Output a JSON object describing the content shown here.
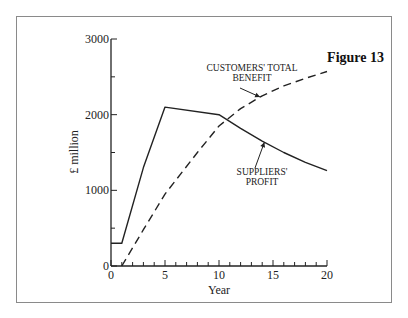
{
  "figure_label": "Figure 13",
  "chart_data": {
    "type": "line",
    "title": "Figure 13",
    "xlabel": "Year",
    "ylabel": "£ million",
    "xlim": [
      0,
      20
    ],
    "ylim": [
      0,
      3000
    ],
    "x_ticks_major": [
      0,
      5,
      10,
      15,
      20
    ],
    "x_ticks_minor_step": 1,
    "y_ticks_major": [
      0,
      1000,
      2000,
      3000
    ],
    "y_ticks_minor_step": 500,
    "grid": false,
    "legend": "none (inline annotations with arrows)",
    "series": [
      {
        "name": "Suppliers' profit",
        "style": "solid",
        "x": [
          0,
          1,
          3,
          5,
          10,
          12,
          14,
          16,
          18,
          20
        ],
        "y": [
          300,
          300,
          1300,
          2100,
          2000,
          1820,
          1650,
          1500,
          1370,
          1260
        ]
      },
      {
        "name": "Customers' total benefit",
        "style": "dashed",
        "x": [
          1,
          3,
          5,
          8,
          10,
          12,
          14,
          16,
          18,
          20
        ],
        "y": [
          0,
          480,
          950,
          1500,
          1850,
          2080,
          2250,
          2380,
          2480,
          2570
        ]
      }
    ],
    "annotations": [
      {
        "text": [
          "CUSTOMERS' TOTAL",
          "BENEFIT"
        ],
        "points_to": "Customers' total benefit",
        "at_x": 13.8
      },
      {
        "text": [
          "SUPPLIERS'",
          "PROFIT"
        ],
        "points_to": "Suppliers' profit",
        "at_x": 14.2
      }
    ]
  }
}
